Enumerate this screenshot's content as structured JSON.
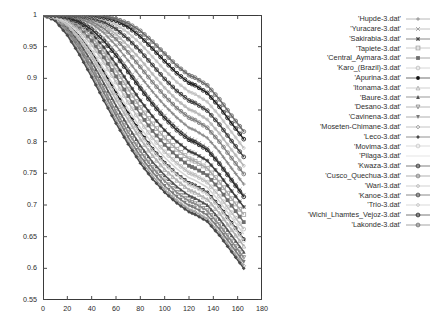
{
  "chart_data": {
    "type": "line",
    "title": "",
    "xlabel": "",
    "ylabel": "",
    "xlim": [
      0,
      180
    ],
    "ylim": [
      0.55,
      1
    ],
    "xticks": [
      0,
      20,
      40,
      60,
      80,
      100,
      120,
      140,
      160,
      180
    ],
    "yticks": [
      0.55,
      0.6,
      0.65,
      0.7,
      0.75,
      0.8,
      0.85,
      0.9,
      0.95,
      1
    ],
    "grid": false,
    "legend_position": "right",
    "series": [
      {
        "name": "'Hupde-3.dat'",
        "marker": "plus",
        "color": "#8c8c8c",
        "x": [
          0,
          10,
          20,
          30,
          40,
          50,
          60,
          70,
          80,
          90,
          100,
          110,
          120,
          125,
          135,
          145,
          155,
          165
        ],
        "y": [
          1.0,
          1.0,
          0.998,
          0.994,
          0.986,
          0.972,
          0.952,
          0.928,
          0.903,
          0.879,
          0.857,
          0.838,
          0.822,
          0.818,
          0.806,
          0.784,
          0.758,
          0.733
        ]
      },
      {
        "name": "'Yuracare-3.dat'",
        "marker": "x",
        "color": "#9a9a9a",
        "x": [
          0,
          10,
          20,
          30,
          40,
          50,
          60,
          70,
          80,
          90,
          100,
          110,
          120,
          125,
          135,
          145,
          155,
          165
        ],
        "y": [
          1.0,
          1.0,
          0.997,
          0.991,
          0.981,
          0.964,
          0.941,
          0.915,
          0.888,
          0.863,
          0.841,
          0.822,
          0.806,
          0.802,
          0.79,
          0.767,
          0.741,
          0.716
        ]
      },
      {
        "name": "'Sakirabia-3.dat'",
        "marker": "star",
        "color": "#3c3c3c",
        "x": [
          0,
          10,
          20,
          30,
          40,
          50,
          60,
          70,
          80,
          90,
          100,
          110,
          120,
          125,
          135,
          145,
          155,
          165
        ],
        "y": [
          1.0,
          0.999,
          0.995,
          0.986,
          0.971,
          0.949,
          0.922,
          0.893,
          0.865,
          0.84,
          0.818,
          0.8,
          0.785,
          0.781,
          0.77,
          0.748,
          0.722,
          0.697
        ]
      },
      {
        "name": "'Tapiete-3.dat'",
        "marker": "square-open",
        "color": "#a8a8a8",
        "x": [
          0,
          10,
          20,
          30,
          40,
          50,
          60,
          70,
          80,
          90,
          100,
          110,
          120,
          125,
          135,
          145,
          155,
          165
        ],
        "y": [
          1.0,
          0.999,
          0.994,
          0.983,
          0.966,
          0.942,
          0.913,
          0.883,
          0.854,
          0.828,
          0.806,
          0.788,
          0.773,
          0.769,
          0.758,
          0.736,
          0.71,
          0.685
        ]
      },
      {
        "name": "'Central_Aymara-3.dat'",
        "marker": "square-filled",
        "color": "#6e6e6e",
        "x": [
          0,
          10,
          20,
          30,
          40,
          50,
          60,
          70,
          80,
          90,
          100,
          110,
          120,
          125,
          135,
          145,
          155,
          165
        ],
        "y": [
          1.0,
          0.998,
          0.992,
          0.979,
          0.959,
          0.933,
          0.903,
          0.872,
          0.843,
          0.817,
          0.795,
          0.777,
          0.762,
          0.758,
          0.747,
          0.725,
          0.699,
          0.673
        ]
      },
      {
        "name": "'Karo_(Brazil)-3.dat'",
        "marker": "circle-open",
        "color": "#bdbdbd",
        "x": [
          0,
          10,
          20,
          30,
          40,
          50,
          60,
          70,
          80,
          90,
          100,
          110,
          120,
          125,
          135,
          145,
          155,
          165
        ],
        "y": [
          1.0,
          0.998,
          0.99,
          0.975,
          0.953,
          0.925,
          0.894,
          0.862,
          0.832,
          0.806,
          0.784,
          0.766,
          0.751,
          0.747,
          0.736,
          0.714,
          0.688,
          0.662
        ]
      },
      {
        "name": "'Apurina-3.dat'",
        "marker": "circle-filled",
        "color": "#111111",
        "x": [
          0,
          10,
          20,
          30,
          40,
          50,
          60,
          70,
          80,
          90,
          100,
          110,
          120,
          125,
          135,
          145,
          155,
          165
        ],
        "y": [
          1.0,
          0.997,
          0.986,
          0.967,
          0.941,
          0.91,
          0.877,
          0.845,
          0.815,
          0.789,
          0.767,
          0.749,
          0.735,
          0.731,
          0.72,
          0.698,
          0.672,
          0.646
        ]
      },
      {
        "name": "'Itonama-3.dat'",
        "marker": "triangle-open",
        "color": "#b0b0b0",
        "x": [
          0,
          10,
          20,
          30,
          40,
          50,
          60,
          70,
          80,
          90,
          100,
          110,
          120,
          125,
          135,
          145,
          155,
          165
        ],
        "y": [
          1.0,
          0.996,
          0.983,
          0.961,
          0.933,
          0.9,
          0.866,
          0.834,
          0.804,
          0.778,
          0.756,
          0.739,
          0.724,
          0.72,
          0.709,
          0.687,
          0.661,
          0.635
        ]
      },
      {
        "name": "'Baure-3.dat'",
        "marker": "triangle-filled",
        "color": "#555555",
        "x": [
          0,
          10,
          20,
          30,
          40,
          50,
          60,
          70,
          80,
          90,
          100,
          110,
          120,
          125,
          135,
          145,
          155,
          165
        ],
        "y": [
          1.0,
          0.995,
          0.98,
          0.956,
          0.926,
          0.892,
          0.857,
          0.824,
          0.794,
          0.768,
          0.747,
          0.729,
          0.715,
          0.711,
          0.7,
          0.678,
          0.652,
          0.626
        ]
      },
      {
        "name": "'Desano-3.dat'",
        "marker": "down-triangle-open",
        "color": "#8a8a8a",
        "x": [
          0,
          10,
          20,
          30,
          40,
          50,
          60,
          70,
          80,
          90,
          100,
          110,
          120,
          125,
          135,
          145,
          155,
          165
        ],
        "y": [
          1.0,
          0.994,
          0.977,
          0.951,
          0.919,
          0.884,
          0.848,
          0.815,
          0.785,
          0.759,
          0.738,
          0.72,
          0.706,
          0.702,
          0.691,
          0.669,
          0.643,
          0.617
        ]
      },
      {
        "name": "'Cavinena-3.dat'",
        "marker": "down-triangle-filled",
        "color": "#7a7a7a",
        "x": [
          0,
          10,
          20,
          30,
          40,
          50,
          60,
          70,
          80,
          90,
          100,
          110,
          120,
          125,
          135,
          145,
          155,
          165
        ],
        "y": [
          1.0,
          0.993,
          0.974,
          0.946,
          0.913,
          0.877,
          0.841,
          0.807,
          0.777,
          0.752,
          0.73,
          0.713,
          0.699,
          0.695,
          0.684,
          0.662,
          0.636,
          0.61
        ]
      },
      {
        "name": "'Moseten-Chimane-3.dat'",
        "marker": "diamond-open",
        "color": "#9e9e9e",
        "x": [
          0,
          10,
          20,
          30,
          40,
          50,
          60,
          70,
          80,
          90,
          100,
          110,
          120,
          125,
          135,
          145,
          155,
          165
        ],
        "y": [
          1.0,
          0.992,
          0.971,
          0.941,
          0.907,
          0.87,
          0.834,
          0.8,
          0.771,
          0.746,
          0.724,
          0.707,
          0.693,
          0.689,
          0.678,
          0.656,
          0.63,
          0.604
        ]
      },
      {
        "name": "'Leco-3.dat'",
        "marker": "diamond-filled",
        "color": "#4a4a4a",
        "x": [
          0,
          10,
          20,
          30,
          40,
          50,
          60,
          70,
          80,
          90,
          100,
          110,
          120,
          125,
          135,
          145,
          155,
          165
        ],
        "y": [
          1.0,
          0.991,
          0.968,
          0.937,
          0.902,
          0.865,
          0.829,
          0.796,
          0.766,
          0.741,
          0.72,
          0.703,
          0.689,
          0.685,
          0.674,
          0.652,
          0.626,
          0.6
        ]
      },
      {
        "name": "'Movima-3.dat'",
        "marker": "pentagon-open",
        "color": "#c4c4c4",
        "x": [
          0,
          10,
          20,
          30,
          40,
          50,
          60,
          70,
          80,
          90,
          100,
          110,
          120,
          125,
          135,
          145,
          155,
          165
        ],
        "y": [
          1.0,
          0.996,
          0.985,
          0.965,
          0.938,
          0.906,
          0.873,
          0.841,
          0.812,
          0.787,
          0.765,
          0.748,
          0.733,
          0.729,
          0.718,
          0.696,
          0.67,
          0.644
        ]
      },
      {
        "name": "'Pilaga-3.dat'",
        "marker": "none",
        "color": "#d4d4d4",
        "x": [
          0,
          10,
          20,
          30,
          40,
          50,
          60,
          70,
          80,
          90,
          100,
          110,
          120,
          125,
          135,
          145,
          155,
          165
        ],
        "y": [
          1.0,
          0.997,
          0.988,
          0.97,
          0.945,
          0.915,
          0.883,
          0.851,
          0.822,
          0.797,
          0.775,
          0.757,
          0.743,
          0.739,
          0.728,
          0.706,
          0.68,
          0.654
        ]
      },
      {
        "name": "'Kwaza-3.dat'",
        "marker": "circle-dot",
        "color": "#2c2c2c",
        "x": [
          0,
          10,
          20,
          30,
          40,
          50,
          60,
          70,
          80,
          90,
          100,
          110,
          120,
          125,
          135,
          145,
          155,
          165
        ],
        "y": [
          1.0,
          0.999,
          0.996,
          0.989,
          0.977,
          0.959,
          0.936,
          0.91,
          0.884,
          0.859,
          0.837,
          0.818,
          0.803,
          0.799,
          0.787,
          0.765,
          0.739,
          0.713
        ]
      },
      {
        "name": "'Cusco_Quechua-3.dat'",
        "marker": "circle-dot",
        "color": "#7e7e7e",
        "x": [
          0,
          10,
          20,
          30,
          40,
          50,
          60,
          70,
          80,
          90,
          100,
          110,
          120,
          125,
          135,
          145,
          155,
          165
        ],
        "y": [
          1.0,
          1.0,
          0.999,
          0.996,
          0.99,
          0.979,
          0.962,
          0.941,
          0.918,
          0.894,
          0.872,
          0.853,
          0.838,
          0.834,
          0.822,
          0.8,
          0.774,
          0.749
        ]
      },
      {
        "name": "'Wari-3.dat'",
        "marker": "circle-small",
        "color": "#b4b4b4",
        "x": [
          0,
          10,
          20,
          30,
          40,
          50,
          60,
          70,
          80,
          90,
          100,
          110,
          120,
          125,
          135,
          145,
          155,
          165
        ],
        "y": [
          1.0,
          1.0,
          0.999,
          0.997,
          0.993,
          0.984,
          0.97,
          0.951,
          0.93,
          0.907,
          0.885,
          0.866,
          0.851,
          0.847,
          0.835,
          0.813,
          0.787,
          0.762
        ]
      },
      {
        "name": "'Kanoe-3.dat'",
        "marker": "circle-dot",
        "color": "#3e3e3e",
        "x": [
          0,
          10,
          20,
          30,
          40,
          50,
          60,
          70,
          80,
          90,
          100,
          110,
          120,
          125,
          135,
          145,
          155,
          165
        ],
        "y": [
          1.0,
          1.0,
          1.0,
          0.998,
          0.995,
          0.989,
          0.978,
          0.962,
          0.943,
          0.921,
          0.899,
          0.88,
          0.865,
          0.861,
          0.849,
          0.827,
          0.801,
          0.776
        ]
      },
      {
        "name": "'Trio-3.dat'",
        "marker": "circle-small",
        "color": "#c0c0c0",
        "x": [
          0,
          10,
          20,
          30,
          40,
          50,
          60,
          70,
          80,
          90,
          100,
          110,
          120,
          125,
          135,
          145,
          155,
          165
        ],
        "y": [
          1.0,
          1.0,
          1.0,
          0.999,
          0.997,
          0.993,
          0.985,
          0.972,
          0.955,
          0.934,
          0.913,
          0.894,
          0.879,
          0.875,
          0.863,
          0.841,
          0.815,
          0.79
        ]
      },
      {
        "name": "'Wichi_Lhamtes_Vejoz-3.dat'",
        "marker": "circle-dot",
        "color": "#1f1f1f",
        "x": [
          0,
          10,
          20,
          30,
          40,
          50,
          60,
          70,
          80,
          90,
          100,
          110,
          120,
          125,
          135,
          145,
          155,
          165
        ],
        "y": [
          1.0,
          1.0,
          1.0,
          1.0,
          0.999,
          0.996,
          0.991,
          0.981,
          0.966,
          0.947,
          0.927,
          0.908,
          0.893,
          0.889,
          0.877,
          0.855,
          0.829,
          0.804
        ]
      },
      {
        "name": "'Lakonde-3.dat'",
        "marker": "circle-dot",
        "color": "#6a6a6a",
        "x": [
          0,
          10,
          20,
          30,
          40,
          50,
          60,
          70,
          80,
          90,
          100,
          110,
          120,
          125,
          135,
          145,
          155,
          165
        ],
        "y": [
          1.0,
          1.0,
          1.0,
          1.0,
          1.0,
          0.998,
          0.994,
          0.987,
          0.975,
          0.958,
          0.939,
          0.92,
          0.905,
          0.901,
          0.889,
          0.867,
          0.841,
          0.816
        ]
      }
    ]
  },
  "legend": {
    "entries": [
      {
        "label": "'Hupde-3.dat'",
        "marker": "plus",
        "color": "#8c8c8c"
      },
      {
        "label": "'Yuracare-3.dat'",
        "marker": "x",
        "color": "#9a9a9a"
      },
      {
        "label": "'Sakirabia-3.dat'",
        "marker": "star",
        "color": "#3c3c3c"
      },
      {
        "label": "'Tapiete-3.dat'",
        "marker": "square-open",
        "color": "#a8a8a8"
      },
      {
        "label": "'Central_Aymara-3.dat'",
        "marker": "square-filled",
        "color": "#6e6e6e"
      },
      {
        "label": "'Karo_(Brazil)-3.dat'",
        "marker": "circle-open",
        "color": "#bdbdbd"
      },
      {
        "label": "'Apurina-3.dat'",
        "marker": "circle-filled",
        "color": "#111111"
      },
      {
        "label": "'Itonama-3.dat'",
        "marker": "triangle-open",
        "color": "#b0b0b0"
      },
      {
        "label": "'Baure-3.dat'",
        "marker": "triangle-filled",
        "color": "#555555"
      },
      {
        "label": "'Desano-3.dat'",
        "marker": "down-triangle-open",
        "color": "#8a8a8a"
      },
      {
        "label": "'Cavinena-3.dat'",
        "marker": "down-triangle-filled",
        "color": "#7a7a7a"
      },
      {
        "label": "'Moseten-Chimane-3.dat'",
        "marker": "diamond-open",
        "color": "#9e9e9e"
      },
      {
        "label": "'Leco-3.dat'",
        "marker": "diamond-filled",
        "color": "#4a4a4a"
      },
      {
        "label": "'Movima-3.dat'",
        "marker": "pentagon-open",
        "color": "#c4c4c4"
      },
      {
        "label": "'Pilaga-3.dat'",
        "marker": "none",
        "color": "#d4d4d4"
      },
      {
        "label": "'Kwaza-3.dat'",
        "marker": "circle-dot",
        "color": "#2c2c2c"
      },
      {
        "label": "'Cusco_Quechua-3.dat'",
        "marker": "circle-dot",
        "color": "#7e7e7e"
      },
      {
        "label": "'Wari-3.dat'",
        "marker": "circle-small",
        "color": "#b4b4b4"
      },
      {
        "label": "'Kanoe-3.dat'",
        "marker": "circle-dot",
        "color": "#3e3e3e"
      },
      {
        "label": "'Trio-3.dat'",
        "marker": "circle-small",
        "color": "#c0c0c0"
      },
      {
        "label": "'Wichi_Lhamtes_Vejoz-3.dat'",
        "marker": "circle-dot",
        "color": "#1f1f1f"
      },
      {
        "label": "'Lakonde-3.dat'",
        "marker": "circle-dot",
        "color": "#6a6a6a"
      }
    ]
  }
}
